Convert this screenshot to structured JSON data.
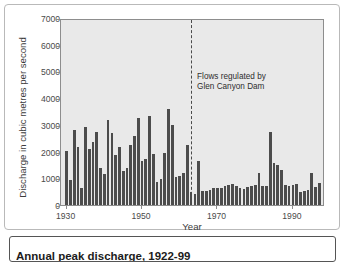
{
  "figure": {
    "caption": "Annual peak discharge, 1922-99"
  },
  "chart_data": {
    "type": "bar",
    "title": "",
    "xlabel": "Year",
    "ylabel": "Discharge in cubic metres per second",
    "xlim": [
      1929,
      1999
    ],
    "ylim": [
      0,
      7000
    ],
    "ytick_values": [
      0,
      1000,
      2000,
      3000,
      4000,
      5000,
      6000,
      7000
    ],
    "ytick_labels": [
      "0",
      "1000",
      "2000",
      "3000",
      "4000",
      "5000",
      "6000",
      "7000"
    ],
    "xtick_values": [
      1930,
      1950,
      1970,
      1990
    ],
    "xtick_labels": [
      "1930",
      "1950",
      "1970",
      "1990"
    ],
    "grid": false,
    "legend": null,
    "bar_color": "#4c4c4c",
    "plot_background": "#e9e9e9",
    "annotations": [
      {
        "name": "regulation-marker",
        "text_line_1": "Flows regulated by",
        "text_line_2": "Glen Canyon Dam",
        "x_value": 1963,
        "style": "dashed-vertical-line"
      }
    ],
    "x": [
      1930,
      1931,
      1932,
      1933,
      1934,
      1935,
      1936,
      1937,
      1938,
      1939,
      1940,
      1941,
      1942,
      1943,
      1944,
      1945,
      1946,
      1947,
      1948,
      1949,
      1950,
      1951,
      1952,
      1953,
      1954,
      1955,
      1956,
      1957,
      1958,
      1959,
      1960,
      1961,
      1962,
      1963,
      1964,
      1965,
      1966,
      1967,
      1968,
      1969,
      1970,
      1971,
      1972,
      1973,
      1974,
      1975,
      1976,
      1977,
      1978,
      1979,
      1980,
      1981,
      1982,
      1983,
      1984,
      1985,
      1986,
      1987,
      1988,
      1989,
      1990,
      1991,
      1992,
      1993,
      1994,
      1995,
      1996,
      1997
    ],
    "values": [
      2030,
      930,
      2800,
      2180,
      650,
      2910,
      2080,
      2350,
      2740,
      1370,
      1150,
      3190,
      2690,
      1860,
      2160,
      1280,
      1400,
      2250,
      2590,
      3260,
      1660,
      1720,
      3340,
      1910,
      870,
      960,
      1950,
      3580,
      3010,
      1030,
      1080,
      1210,
      2250,
      480,
      420,
      1640,
      520,
      540,
      570,
      650,
      620,
      640,
      700,
      760,
      790,
      700,
      640,
      600,
      660,
      720,
      760,
      1210,
      700,
      710,
      2730,
      1590,
      1480,
      1320,
      760,
      720,
      740,
      800,
      490,
      520,
      580,
      1200,
      690,
      820
    ]
  }
}
